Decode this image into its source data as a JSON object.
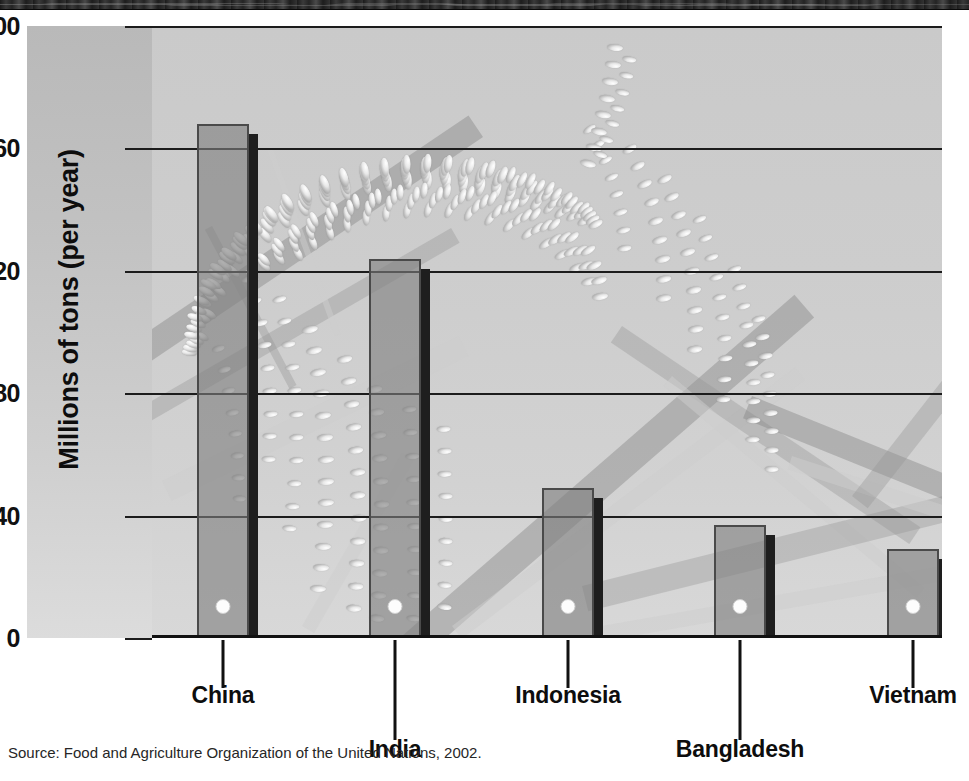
{
  "banner": {
    "name": "decorative-header-band"
  },
  "chart_data": {
    "type": "bar",
    "title": "",
    "categories": [
      "China",
      "India",
      "Indonesia",
      "Bangladesh",
      "Vietnam"
    ],
    "values": [
      168,
      124,
      49,
      37,
      29
    ],
    "xlabel": "",
    "ylabel": "Millions of tons (per year)",
    "ylim": [
      0,
      200
    ],
    "yticks": [
      0,
      40,
      80,
      120,
      160,
      200
    ],
    "ytick_labels": [
      "0",
      "40",
      "80",
      "120",
      "160",
      "200"
    ],
    "grid": true,
    "legend": "none",
    "bar_color": "#808080",
    "bar_border_color": "#4a4a4a",
    "bar_shadow_color": "#1e1e1e",
    "plot_background_color": "#cdcdcd",
    "axis_strip_color": "#c2c2c2",
    "gridline_color": "#1c1c1c",
    "text_color": "#0d0d0d"
  },
  "source": {
    "text": "Source: Food and Agriculture Organization of the United Nations, 2002."
  },
  "artwork": {
    "name": "rice-plant-illustration",
    "description": "drooping rice panicle with grains and straw stalks"
  }
}
